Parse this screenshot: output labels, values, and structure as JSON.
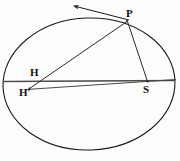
{
  "figure": {
    "type": "geometry-diagram",
    "background_color": "#fdfdfc",
    "stroke_color": "#1a1a1a",
    "label_color": "#111111",
    "canvas": {
      "width": 180,
      "height": 161
    }
  },
  "labels": {
    "p": "P",
    "h": "H",
    "h_prime": "H'",
    "s": "S"
  },
  "geometry": {
    "ellipse": {
      "cx": 89,
      "cy": 84,
      "rx": 86,
      "ry": 66,
      "rotation_deg": -2
    },
    "points": {
      "P": {
        "x": 127,
        "y": 21
      },
      "H": {
        "x": 40,
        "y": 79
      },
      "Hp": {
        "x": 30,
        "y": 88
      },
      "S": {
        "x": 148,
        "y": 82
      },
      "arrow_tip": {
        "x": 72,
        "y": 5
      }
    },
    "segments": [
      {
        "name": "major-axis",
        "from": "left-vertex",
        "to": "right-vertex"
      },
      {
        "name": "h-prime-axis-line",
        "from": "Hp",
        "to": "right-edge"
      },
      {
        "name": "segment-P-Hp",
        "from": "P",
        "to": "Hp"
      },
      {
        "name": "segment-P-S",
        "from": "P",
        "to": "S"
      },
      {
        "name": "tangent-arrow",
        "from": "P",
        "to": "arrow_tip"
      }
    ]
  }
}
